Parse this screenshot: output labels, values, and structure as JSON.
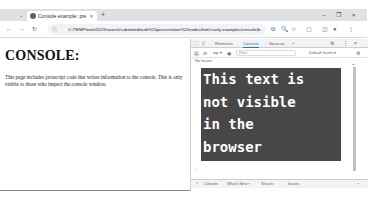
{
  "browser": {
    "tab": {
      "title": "Console example: presentation",
      "close_icon": "×"
    },
    "new_tab_icon": "+",
    "tab_dropdown_icon": "⌄",
    "window_controls": {
      "minimize": "–",
      "maximize": "❐",
      "close": "×"
    },
    "nav": {
      "back": "←",
      "forward": "→",
      "reload": "↻"
    },
    "address": {
      "info_icon": "ⓘ",
      "protocol_label": "File",
      "url": "C:/TEMP/work2023/search/submitted/web%20presentation%20nodes/html-early-examples/console/b..."
    },
    "toolbar_icons": [
      "⧉",
      "🔍",
      "☆",
      "▢",
      "◫",
      "●",
      "⋮"
    ]
  },
  "page": {
    "heading": "CONSOLE:",
    "paragraph": "This page includes javascript code that writes information to the console. This is only visible to those who inspect the console window."
  },
  "devtools": {
    "tabs": [
      {
        "label": "Elements",
        "active": false
      },
      {
        "label": "Console",
        "active": true
      },
      {
        "label": "Sources",
        "active": false
      },
      {
        "label": "»",
        "active": false
      }
    ],
    "icons": {
      "inspect": "⬚",
      "device": "▯",
      "settings": "⚙",
      "more": "⋮",
      "close": "×"
    },
    "toolbar": {
      "sidebar_icon": "▤",
      "clear_icon": "⊘",
      "context": "top ▾",
      "eye_icon": "◉",
      "filter_placeholder": "Filter",
      "levels": "Default levels ▾",
      "settings_icon": "⚙"
    },
    "issues_label": "No Issues",
    "console_message": "This text is\nnot visible\nin the\nbrowser",
    "console_bg": "#474747",
    "prompt": "›",
    "drawer": {
      "menu_icon": "⋮",
      "tabs": [
        "Console",
        "What's New ×",
        "Search",
        "Issues"
      ],
      "close_icon": "×"
    }
  }
}
